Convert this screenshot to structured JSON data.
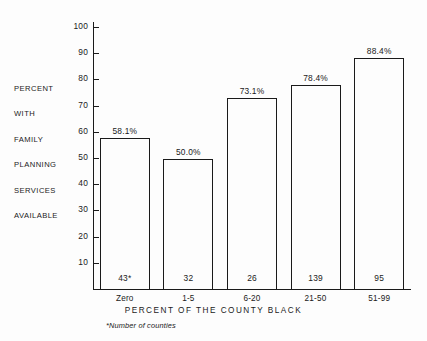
{
  "chart_data": {
    "type": "bar",
    "title": "",
    "categories": [
      "Zero",
      "1-5",
      "6-20",
      "21-50",
      "51-99"
    ],
    "values": [
      58.1,
      50.0,
      73.1,
      78.4,
      88.4
    ],
    "value_labels": [
      "58.1%",
      "50.0%",
      "73.1%",
      "78.4%",
      "88.4%"
    ],
    "counts": [
      "43*",
      "32",
      "26",
      "139",
      "95"
    ],
    "xlabel": "PERCENT OF THE COUNTY BLACK",
    "ylabel_lines": [
      "PERCENT",
      "WITH",
      "FAMILY",
      "PLANNING",
      "SERVICES",
      "AVAILABLE"
    ],
    "ytick_labels": [
      "100",
      "90",
      "80",
      "70",
      "60",
      "50",
      "40",
      "30",
      "20",
      "10"
    ],
    "ytick_values": [
      100,
      90,
      80,
      70,
      60,
      50,
      40,
      30,
      20,
      10
    ],
    "ylim": [
      0,
      100
    ],
    "grid": false,
    "legend": "none",
    "footnote": "*Number of counties",
    "bar_fill": "#ffffff",
    "bar_edge": "#1a1a1a",
    "background": "#fdfdfd"
  }
}
